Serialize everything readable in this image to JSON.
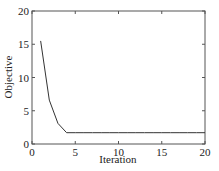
{
  "chart_data": {
    "type": "line",
    "title": "",
    "xlabel": "Iteration",
    "ylabel": "Objective",
    "xlim": [
      0,
      20
    ],
    "ylim": [
      0,
      20
    ],
    "xticks": [
      0,
      5,
      10,
      15,
      20
    ],
    "yticks": [
      0,
      5,
      10,
      15,
      20
    ],
    "grid": false,
    "legend": null,
    "series": [
      {
        "name": "Objective",
        "x": [
          1,
          2,
          3,
          4,
          5,
          6,
          7,
          8,
          9,
          10,
          11,
          12,
          13,
          14,
          15,
          16,
          17,
          18,
          19,
          20
        ],
        "values": [
          15.5,
          6.6,
          3.1,
          1.7,
          1.7,
          1.7,
          1.7,
          1.7,
          1.7,
          1.7,
          1.7,
          1.7,
          1.7,
          1.7,
          1.7,
          1.7,
          1.7,
          1.7,
          1.7,
          1.7
        ]
      }
    ],
    "line_color": "#333333"
  }
}
